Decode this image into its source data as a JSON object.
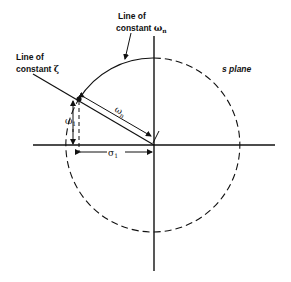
{
  "diagram": {
    "type": "s-plane pole geometry",
    "plane_label": "s plane",
    "labels": {
      "const_wn_line1": "Line of",
      "const_wn_line2": "constant ",
      "const_wn_symbol": "ω",
      "const_wn_sub": "n",
      "const_zeta_line1": "Line of",
      "const_zeta_line2": "constant ",
      "const_zeta_symbol": "ζ",
      "wn_symbol": "ω",
      "wn_sub": "n",
      "w1_symbol": "ω",
      "w1_sub": "1",
      "sigma1_symbol": "σ",
      "sigma1_sub": "1"
    },
    "elements": [
      "real-axis",
      "imaginary-axis",
      "circle-constant-wn (solid upper-left arc, dashed remainder)",
      "line-constant-zeta",
      "pole-point",
      "wn-dimension-arrow",
      "w1-dimension-arrow",
      "sigma1-dimension-arrow"
    ],
    "colors": {
      "ink": "#111111",
      "background": "#ffffff"
    }
  }
}
